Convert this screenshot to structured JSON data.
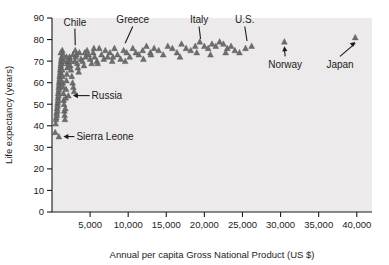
{
  "chart_data": {
    "type": "scatter",
    "title": "",
    "xlabel": "Annual per capita Gross National Product (US $)",
    "ylabel": "Life expectancy (years)",
    "xlim": [
      0,
      42000
    ],
    "ylim": [
      0,
      90
    ],
    "xticks": [
      0,
      5000,
      10000,
      15000,
      20000,
      25000,
      30000,
      35000,
      40000
    ],
    "xticklabels": [
      "",
      "5,000",
      "10,000",
      "15,000",
      "20,000",
      "25,000",
      "30,000",
      "35,000",
      "40,000"
    ],
    "yticks": [
      0,
      10,
      20,
      30,
      40,
      50,
      60,
      70,
      80,
      90
    ],
    "yticklabels": [
      "0",
      "10",
      "20",
      "30",
      "40",
      "50",
      "60",
      "70",
      "80",
      "90"
    ],
    "grid": false,
    "legend": null,
    "marker": "triangle",
    "marker_color": "#6e6e6e",
    "plot_background": "#eceaea",
    "points": [
      [
        420,
        37
      ],
      [
        480,
        41
      ],
      [
        520,
        43
      ],
      [
        560,
        44
      ],
      [
        600,
        46
      ],
      [
        640,
        45
      ],
      [
        660,
        48
      ],
      [
        700,
        47
      ],
      [
        720,
        50
      ],
      [
        740,
        49
      ],
      [
        760,
        51
      ],
      [
        780,
        53
      ],
      [
        800,
        52
      ],
      [
        820,
        55
      ],
      [
        850,
        54
      ],
      [
        870,
        56
      ],
      [
        890,
        58
      ],
      [
        910,
        57
      ],
      [
        930,
        60
      ],
      [
        950,
        59
      ],
      [
        980,
        61
      ],
      [
        1000,
        63
      ],
      [
        1020,
        62
      ],
      [
        1050,
        64
      ],
      [
        1080,
        66
      ],
      [
        1100,
        65
      ],
      [
        1130,
        67
      ],
      [
        1150,
        68
      ],
      [
        1180,
        69
      ],
      [
        1200,
        70
      ],
      [
        1230,
        71
      ],
      [
        1260,
        72
      ],
      [
        1300,
        69
      ],
      [
        1340,
        66
      ],
      [
        1380,
        63
      ],
      [
        1420,
        60
      ],
      [
        1460,
        58
      ],
      [
        1500,
        55
      ],
      [
        1540,
        52
      ],
      [
        1580,
        50
      ],
      [
        1620,
        47
      ],
      [
        1660,
        45
      ],
      [
        1700,
        43
      ],
      [
        1750,
        48
      ],
      [
        1800,
        53
      ],
      [
        1850,
        57
      ],
      [
        1900,
        61
      ],
      [
        1950,
        64
      ],
      [
        2000,
        67
      ],
      [
        2050,
        69
      ],
      [
        2100,
        70
      ],
      [
        2200,
        71
      ],
      [
        2300,
        72
      ],
      [
        2400,
        68
      ],
      [
        2500,
        66
      ],
      [
        2600,
        63
      ],
      [
        2700,
        60
      ],
      [
        2800,
        58
      ],
      [
        2900,
        56
      ],
      [
        3000,
        70
      ],
      [
        3100,
        72
      ],
      [
        3200,
        73
      ],
      [
        3300,
        69
      ],
      [
        3400,
        67
      ],
      [
        3500,
        65
      ],
      [
        3600,
        74
      ],
      [
        3800,
        71
      ],
      [
        4000,
        70
      ],
      [
        4200,
        68
      ],
      [
        4400,
        72
      ],
      [
        4600,
        75
      ],
      [
        4800,
        73
      ],
      [
        5000,
        71
      ],
      [
        5200,
        69
      ],
      [
        5400,
        74
      ],
      [
        5600,
        72
      ],
      [
        5900,
        70
      ],
      [
        6200,
        76
      ],
      [
        6500,
        73
      ],
      [
        6800,
        71
      ],
      [
        7000,
        75
      ],
      [
        7300,
        72
      ],
      [
        7600,
        74
      ],
      [
        7900,
        70
      ],
      [
        8200,
        76
      ],
      [
        8600,
        73
      ],
      [
        9000,
        71
      ],
      [
        9400,
        75
      ],
      [
        9800,
        74
      ],
      [
        10200,
        72
      ],
      [
        10600,
        76
      ],
      [
        11000,
        74
      ],
      [
        11400,
        73
      ],
      [
        11900,
        75
      ],
      [
        12400,
        77
      ],
      [
        12900,
        74
      ],
      [
        13400,
        76
      ],
      [
        14000,
        75
      ],
      [
        14600,
        73
      ],
      [
        15200,
        77
      ],
      [
        15800,
        76
      ],
      [
        16400,
        74
      ],
      [
        17000,
        78
      ],
      [
        17600,
        76
      ],
      [
        18200,
        75
      ],
      [
        18800,
        77
      ],
      [
        19400,
        79
      ],
      [
        20000,
        77
      ],
      [
        20500,
        76
      ],
      [
        21000,
        78
      ],
      [
        21500,
        77
      ],
      [
        22000,
        79
      ],
      [
        22500,
        78
      ],
      [
        23000,
        76
      ],
      [
        23500,
        77
      ],
      [
        24000,
        75
      ],
      [
        24600,
        74
      ],
      [
        25400,
        76
      ],
      [
        26200,
        77
      ],
      [
        30500,
        79
      ],
      [
        39800,
        81
      ],
      [
        1600,
        70
      ],
      [
        2150,
        54
      ],
      [
        3050,
        75
      ],
      [
        900,
        35
      ],
      [
        1350,
        75
      ],
      [
        2750,
        73
      ],
      [
        4300,
        74
      ],
      [
        5500,
        76
      ],
      [
        6000,
        69
      ],
      [
        8000,
        72
      ],
      [
        9600,
        70
      ],
      [
        12000,
        71
      ],
      [
        13000,
        73
      ],
      [
        16800,
        72
      ],
      [
        19000,
        74
      ],
      [
        20800,
        73
      ],
      [
        22800,
        74
      ],
      [
        1150,
        74
      ],
      [
        1480,
        73
      ],
      [
        1900,
        72
      ],
      [
        2480,
        70
      ]
    ],
    "annotations": [
      {
        "label": "Chile",
        "x": 3050,
        "y": 75,
        "label_x": 3000,
        "label_y": 86,
        "style": "line-down"
      },
      {
        "label": "Greece",
        "x": 9600,
        "y": 76,
        "label_x": 10600,
        "label_y": 87,
        "style": "line-down"
      },
      {
        "label": "Italy",
        "x": 19500,
        "y": 78,
        "label_x": 19300,
        "label_y": 87,
        "style": "line-down"
      },
      {
        "label": "U.S.",
        "x": 25600,
        "y": 77,
        "label_x": 25300,
        "label_y": 87,
        "style": "line-down"
      },
      {
        "label": "Norway",
        "x": 30500,
        "y": 79,
        "label_x": 30600,
        "label_y": 68,
        "style": "arrow-up"
      },
      {
        "label": "Japan",
        "x": 39800,
        "y": 81,
        "label_x": 37800,
        "label_y": 68,
        "style": "arrow-up-right"
      },
      {
        "label": "Russia",
        "x": 2150,
        "y": 54,
        "label_x": 5200,
        "label_y": 54,
        "style": "arrow-left"
      },
      {
        "label": "Sierra Leone",
        "x": 900,
        "y": 35,
        "label_x": 3200,
        "label_y": 35,
        "style": "arrow-left"
      }
    ]
  }
}
